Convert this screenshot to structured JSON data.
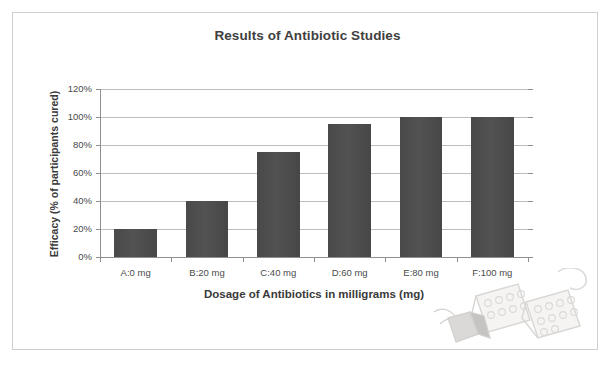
{
  "chart_data": {
    "type": "bar",
    "title": "Results of Antibiotic Studies",
    "xlabel": "Dosage of Antibiotics in milligrams (mg)",
    "ylabel": "Efficacy (% of participants cured)",
    "categories": [
      "A:0 mg",
      "B:20 mg",
      "C:40 mg",
      "D:60 mg",
      "E:80 mg",
      "F:100 mg"
    ],
    "values": [
      20,
      40,
      75,
      95,
      100,
      100
    ],
    "ytick_labels": [
      "120%",
      "100%",
      "80%",
      "60%",
      "40%",
      "20%",
      "0%"
    ],
    "ytick_values": [
      120,
      100,
      80,
      60,
      40,
      20,
      0
    ],
    "ylim": [
      0,
      120
    ],
    "grid": true,
    "legend": "none",
    "bar_color": "#4d4d4d",
    "gridline_color": "#bdbdbd",
    "axis_color": "#8f8f8f"
  },
  "decoration": {
    "watermark_label": "pill-blister-pack-illustration"
  }
}
